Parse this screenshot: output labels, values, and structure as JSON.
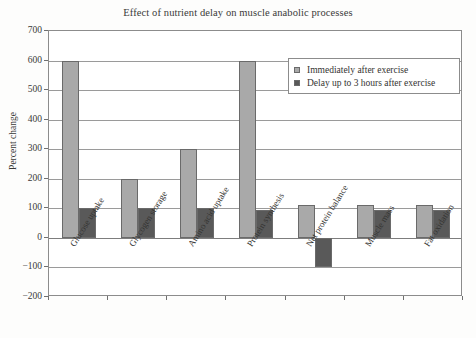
{
  "chart_data": {
    "type": "bar",
    "title": "Effect of nutrient delay on muscle anabolic processes",
    "xlabel": "",
    "ylabel": "Percent change",
    "ylim": [
      -200,
      700
    ],
    "ytick_step": 100,
    "yticks": [
      700,
      600,
      500,
      400,
      300,
      200,
      100,
      0,
      -100,
      -200
    ],
    "ytick_labels": [
      "700",
      "600",
      "500",
      "400",
      "300",
      "200",
      "100",
      "0",
      "−100",
      "−200"
    ],
    "grid": true,
    "legend_position": "upper right",
    "categories": [
      "Glucose uptake",
      "Glycogen storage",
      "Amino acid uptake",
      "Protein synthesis",
      "Net protein balance",
      "Muscle mass",
      "Fat oxidation"
    ],
    "series": [
      {
        "name": "Immediately after exercise",
        "color": "#a9a9a9",
        "values": [
          600,
          200,
          300,
          600,
          110,
          110,
          110
        ]
      },
      {
        "name": "Delay up to 3 hours after exercise",
        "color": "#595959",
        "values": [
          100,
          100,
          100,
          95,
          -100,
          95,
          95
        ]
      }
    ]
  },
  "colors": {
    "series_light": "#a9a9a9",
    "series_dark": "#595959",
    "axis": "#6f6f6f",
    "grid": "#9a9a9a",
    "text": "#343432",
    "background": "#fdfdfc"
  }
}
